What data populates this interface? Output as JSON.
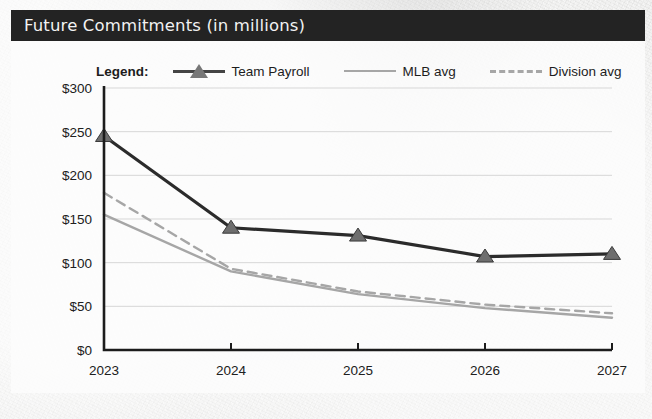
{
  "header": {
    "title": "Future Commitments (in millions)",
    "bar_color": "#232323",
    "text_color": "#f2f2f2"
  },
  "legend": {
    "title": "Legend:",
    "entries": [
      {
        "label": "Team Payroll",
        "style": "solid-marker",
        "color": "#444444",
        "marker": "triangle"
      },
      {
        "label": "MLB avg",
        "style": "solid",
        "color": "#a6a6a6",
        "marker": "none"
      },
      {
        "label": "Division avg",
        "style": "dashed",
        "color": "#a6a6a6",
        "marker": "none"
      }
    ]
  },
  "chart_data": {
    "type": "line",
    "title": "Future Commitments (in millions)",
    "xlabel": "",
    "ylabel": "",
    "categories": [
      "2023",
      "2024",
      "2025",
      "2026",
      "2027"
    ],
    "x_tick_labels": [
      "2023",
      "2024",
      "2025",
      "2026",
      "2027"
    ],
    "y_tick_labels": [
      "$0",
      "$50",
      "$100",
      "$150",
      "$200",
      "$250",
      "$300"
    ],
    "y_tick_values": [
      0,
      50,
      100,
      150,
      200,
      250,
      300
    ],
    "ylim": [
      0,
      300
    ],
    "grid": true,
    "grid_axis": "y",
    "legend_position": "top",
    "series": [
      {
        "name": "Team Payroll",
        "values": [
          245,
          140,
          131,
          107,
          110
        ],
        "color": "#2b2b2b",
        "line_style": "solid",
        "marker": "triangle"
      },
      {
        "name": "MLB avg",
        "values": [
          155,
          90,
          64,
          48,
          37
        ],
        "color": "#a6a6a6",
        "line_style": "solid",
        "marker": "none"
      },
      {
        "name": "Division avg",
        "values": [
          180,
          93,
          67,
          52,
          42
        ],
        "color": "#a6a6a6",
        "line_style": "dashed",
        "marker": "none"
      }
    ]
  }
}
